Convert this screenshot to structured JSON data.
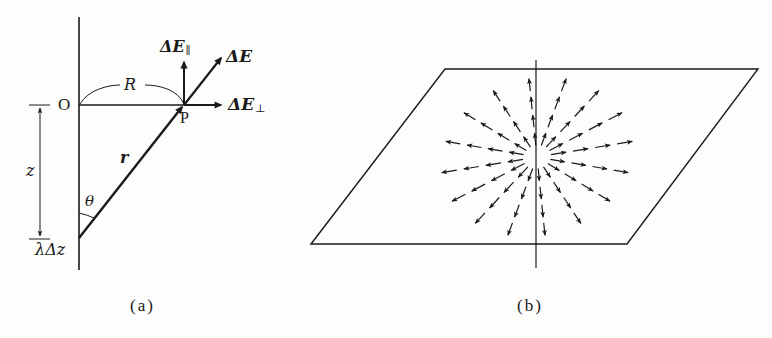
{
  "figure_a": {
    "caption": "(a)",
    "labels": {
      "origin": "O",
      "point": "P",
      "radius": "R",
      "distance": "z",
      "position_vector": "r",
      "angle": "θ",
      "charge_element": "λΔz",
      "field_total_symbol": "ΔE",
      "field_parallel_symbol": "ΔE",
      "field_parallel_sub": "∥",
      "field_perp_symbol": "ΔE",
      "field_perp_sub": "⊥"
    }
  },
  "figure_b": {
    "caption": "(b)",
    "description": "Radial field arrows on a plane perpendicular to a line of charge",
    "radial_directions": 16
  },
  "colors": {
    "ink": "#1a1a1a",
    "background": "#fdfdfb"
  }
}
